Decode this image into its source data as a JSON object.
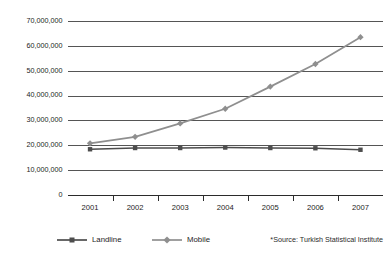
{
  "chart_data": {
    "type": "line",
    "title": "",
    "subtitle": "",
    "xlabel": "",
    "ylabel": "",
    "categories": [
      "2001",
      "2002",
      "2003",
      "2004",
      "2005",
      "2006",
      "2007"
    ],
    "ylim": [
      0,
      70000000
    ],
    "ytick_values": [
      0,
      10000000,
      20000000,
      30000000,
      40000000,
      50000000,
      60000000,
      70000000
    ],
    "ytick_labels": [
      "0",
      "10,000,000",
      "20,000,000",
      "30,000,000",
      "40,000,000",
      "50,000,000",
      "60,000,000",
      "70,000,000"
    ],
    "grid": true,
    "legend_position": "bottom",
    "series": [
      {
        "name": "Landline",
        "color": "#4d4d4d",
        "marker": "square",
        "values": [
          18400000,
          18900000,
          18900000,
          19100000,
          18900000,
          18800000,
          18200000
        ]
      },
      {
        "name": "Mobile",
        "color": "#8f8f8f",
        "marker": "diamond",
        "values": [
          20800000,
          23400000,
          28800000,
          34700000,
          43600000,
          52700000,
          63500000
        ]
      }
    ],
    "annotations": [
      {
        "name": "source-note",
        "text": "*Source: Turkish Statistical Institute"
      }
    ]
  },
  "legend": {
    "items": [
      {
        "label": "Landline"
      },
      {
        "label": "Mobile"
      }
    ]
  },
  "footer": {
    "source": "*Source: Turkish Statistical Institute"
  },
  "colors": {
    "landline": "#4d4d4d",
    "mobile": "#8f8f8f",
    "grid": "#555555",
    "axis": "#2b2b2b",
    "text": "#1c1c1c",
    "background": "#ffffff"
  }
}
